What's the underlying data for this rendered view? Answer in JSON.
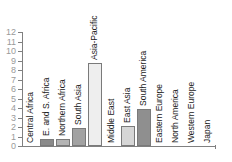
{
  "chart_data": {
    "type": "bar",
    "title": "",
    "xlabel": "",
    "ylabel": "",
    "ylim": [
      0,
      12
    ],
    "yticks": [
      0,
      1,
      2,
      3,
      4,
      5,
      6,
      7,
      8,
      9,
      10,
      11,
      12
    ],
    "grid": false,
    "legend": null,
    "categories": [
      "Central Africa",
      "E. and S. Africa",
      "Northern Africa",
      "South Asia",
      "Asia-Pacific",
      "Middle East",
      "East Asia",
      "South America",
      "Eastern Europe",
      "North America",
      "Western Europe",
      "Japan"
    ],
    "values": [
      0,
      0.75,
      0.75,
      1.85,
      8.7,
      0,
      2.1,
      3.9,
      0,
      0,
      0,
      0
    ],
    "colors": [
      "#9a9a9a",
      "#8a8a8a",
      "#b4b4b4",
      "#a2a2a2",
      "#eeeeee",
      "#cccccc",
      "#d6d6d6",
      "#8f8f8f",
      "#cccccc",
      "#cccccc",
      "#cccccc",
      "#cccccc"
    ]
  }
}
